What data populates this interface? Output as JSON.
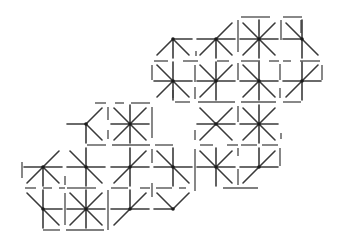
{
  "puzzle": {
    "type": "star-rays-grid",
    "cell_size": 43,
    "colors": {
      "ray": "#3a3a3a",
      "wall": "#555555",
      "hub": "#1a1a1a",
      "background": "#ffffff"
    },
    "cells": [
      {
        "id": "r0c3",
        "cx": 173,
        "cy": 39,
        "rays": [
          "E",
          "S",
          "SW",
          "SE"
        ]
      },
      {
        "id": "r0c4",
        "cx": 216,
        "cy": 39,
        "rays": [
          "W",
          "E",
          "NE",
          "S",
          "SW",
          "SE"
        ]
      },
      {
        "id": "r0c5",
        "cx": 259,
        "cy": 39,
        "rays": [
          "N",
          "NE",
          "E",
          "SE",
          "S",
          "SW",
          "W",
          "NW"
        ]
      },
      {
        "id": "r0c6",
        "cx": 302,
        "cy": 39,
        "rays": [
          "N",
          "NW",
          "W",
          "S",
          "SE"
        ]
      },
      {
        "id": "r1c3",
        "cx": 173,
        "cy": 81,
        "rays": [
          "N",
          "NW",
          "W",
          "E",
          "S",
          "SW",
          "SE"
        ]
      },
      {
        "id": "r1c4",
        "cx": 216,
        "cy": 81,
        "rays": [
          "N",
          "NE",
          "W",
          "E",
          "S",
          "SW",
          "NW"
        ]
      },
      {
        "id": "r1c5",
        "cx": 259,
        "cy": 81,
        "rays": [
          "N",
          "NW",
          "W",
          "E",
          "S",
          "SW",
          "SE"
        ]
      },
      {
        "id": "r1c6",
        "cx": 302,
        "cy": 81,
        "rays": [
          "N",
          "NE",
          "W",
          "E",
          "S",
          "SW"
        ]
      },
      {
        "id": "r2c1",
        "cx": 86,
        "cy": 124,
        "rays": [
          "W",
          "NE",
          "SE",
          "S"
        ]
      },
      {
        "id": "r2c2",
        "cx": 130,
        "cy": 124,
        "rays": [
          "N",
          "NE",
          "E",
          "SE",
          "S",
          "SW",
          "W",
          "NW"
        ]
      },
      {
        "id": "r2c4",
        "cx": 216,
        "cy": 124,
        "rays": [
          "NW",
          "NE",
          "W",
          "E",
          "SW",
          "SE"
        ]
      },
      {
        "id": "r2c5",
        "cx": 259,
        "cy": 124,
        "rays": [
          "N",
          "NE",
          "E",
          "SE",
          "S",
          "SW",
          "W",
          "NW"
        ]
      },
      {
        "id": "r3c0",
        "cx": 43,
        "cy": 167,
        "rays": [
          "NE",
          "W",
          "E",
          "S",
          "SW",
          "SE"
        ]
      },
      {
        "id": "r3c1",
        "cx": 86,
        "cy": 167,
        "rays": [
          "N",
          "NW",
          "W",
          "E",
          "S",
          "SE"
        ]
      },
      {
        "id": "r3c2",
        "cx": 130,
        "cy": 167,
        "rays": [
          "N",
          "NE",
          "W",
          "E",
          "S",
          "SW"
        ]
      },
      {
        "id": "r3c3",
        "cx": 173,
        "cy": 167,
        "rays": [
          "N",
          "NW",
          "W",
          "E",
          "S",
          "SE"
        ]
      },
      {
        "id": "r3c4",
        "cx": 216,
        "cy": 167,
        "rays": [
          "N",
          "NW",
          "NE",
          "W",
          "E",
          "S",
          "SE"
        ]
      },
      {
        "id": "r3c5",
        "cx": 259,
        "cy": 167,
        "rays": [
          "N",
          "NE",
          "W",
          "E",
          "SW"
        ]
      },
      {
        "id": "r4c0",
        "cx": 43,
        "cy": 209,
        "rays": [
          "NW",
          "N",
          "E",
          "S",
          "SE"
        ]
      },
      {
        "id": "r4c1",
        "cx": 86,
        "cy": 209,
        "rays": [
          "N",
          "NE",
          "E",
          "SE",
          "S",
          "SW",
          "W",
          "NW"
        ]
      },
      {
        "id": "r4c2",
        "cx": 130,
        "cy": 209,
        "rays": [
          "N",
          "NE",
          "W",
          "E",
          "SW"
        ]
      },
      {
        "id": "r4c3",
        "cx": 173,
        "cy": 209,
        "rays": [
          "NW",
          "NE",
          "W"
        ]
      }
    ],
    "walls": [
      [
        241,
        17,
        270,
        17
      ],
      [
        283,
        17,
        302,
        17
      ],
      [
        238,
        20,
        238,
        52
      ],
      [
        281,
        20,
        281,
        40
      ],
      [
        301,
        20,
        301,
        33
      ],
      [
        196,
        51,
        196,
        56
      ],
      [
        154,
        61,
        168,
        61
      ],
      [
        183,
        61,
        198,
        61
      ],
      [
        217,
        61,
        229,
        61
      ],
      [
        241,
        61,
        260,
        61
      ],
      [
        269,
        61,
        279,
        61
      ],
      [
        283,
        61,
        291,
        61
      ],
      [
        300,
        61,
        320,
        61
      ],
      [
        152,
        65,
        152,
        80
      ],
      [
        195,
        65,
        195,
        82
      ],
      [
        238,
        63,
        238,
        80
      ],
      [
        280,
        64,
        280,
        80
      ],
      [
        322,
        65,
        322,
        80
      ],
      [
        173,
        90,
        173,
        98
      ],
      [
        195,
        87,
        195,
        99
      ],
      [
        280,
        88,
        280,
        98
      ],
      [
        175,
        102,
        190,
        102
      ],
      [
        198,
        102,
        235,
        102
      ],
      [
        241,
        102,
        276,
        102
      ],
      [
        283,
        102,
        301,
        102
      ],
      [
        95,
        103,
        106,
        103
      ],
      [
        115,
        103,
        124,
        103
      ],
      [
        131,
        103,
        150,
        103
      ],
      [
        108,
        107,
        108,
        120
      ],
      [
        152,
        107,
        152,
        138
      ],
      [
        238,
        106,
        238,
        122
      ],
      [
        108,
        130,
        108,
        139
      ],
      [
        195,
        130,
        195,
        140
      ],
      [
        281,
        133,
        281,
        139
      ],
      [
        87,
        145,
        106,
        145
      ],
      [
        112,
        145,
        150,
        145
      ],
      [
        155,
        145,
        173,
        145
      ],
      [
        200,
        145,
        213,
        145
      ],
      [
        227,
        145,
        238,
        145
      ],
      [
        241,
        145,
        257,
        145
      ],
      [
        262,
        145,
        278,
        145
      ],
      [
        152,
        149,
        152,
        163
      ],
      [
        195,
        149,
        195,
        191
      ],
      [
        238,
        148,
        238,
        156
      ],
      [
        280,
        148,
        280,
        166
      ],
      [
        22,
        162,
        22,
        178
      ],
      [
        238,
        169,
        238,
        185
      ],
      [
        25,
        188,
        36,
        188
      ],
      [
        43,
        188,
        52,
        188
      ],
      [
        59,
        188,
        65,
        188
      ],
      [
        67,
        188,
        96,
        188
      ],
      [
        111,
        188,
        128,
        188
      ],
      [
        140,
        188,
        150,
        188
      ],
      [
        156,
        188,
        172,
        188
      ],
      [
        179,
        188,
        186,
        188
      ],
      [
        65,
        176,
        65,
        185
      ],
      [
        152,
        183,
        152,
        197
      ],
      [
        65,
        193,
        65,
        225
      ],
      [
        108,
        190,
        108,
        230
      ],
      [
        223,
        188,
        258,
        188
      ],
      [
        43,
        230,
        60,
        230
      ],
      [
        66,
        230,
        104,
        230
      ]
    ]
  }
}
